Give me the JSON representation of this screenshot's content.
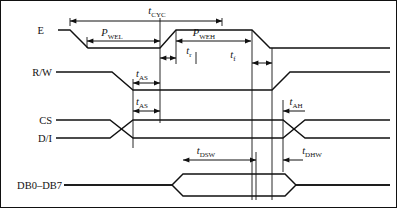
{
  "diagram": {
    "type": "timing-diagram",
    "border": {
      "color": "#111111",
      "width": 1
    },
    "signals": [
      {
        "name": "E",
        "label": "E",
        "row": "e-row"
      },
      {
        "name": "R/W",
        "label": "R/W",
        "row": "rw-row"
      },
      {
        "name": "CS",
        "label": "CS",
        "row": "cs-row"
      },
      {
        "name": "D/I",
        "label": "D/I",
        "row": "di-row"
      },
      {
        "name": "DB0-DB7",
        "label": "DB0–DB7",
        "row": "db-row"
      }
    ],
    "timings": [
      {
        "id": "tCYC",
        "base": "t",
        "sub": "CYC",
        "x": 157,
        "y": 14,
        "span": [
          70,
          222
        ],
        "arrow_y": 21
      },
      {
        "id": "PWEL",
        "base": "P",
        "sub": "WEL",
        "x": 112,
        "y": 34,
        "span": [
          87,
          160
        ],
        "arrow_y": 41
      },
      {
        "id": "PWEH",
        "base": "P",
        "sub": "WEH",
        "x": 200,
        "y": 34,
        "span": [
          176,
          251
        ],
        "arrow_y": 41
      },
      {
        "id": "tr",
        "base": "t",
        "sub": "r",
        "x": 188,
        "y": 52,
        "span": [
          176,
          196
        ],
        "arrow_y": 58
      },
      {
        "id": "tf",
        "base": "t",
        "sub": "f",
        "x": 232,
        "y": 56,
        "span": [
          252,
          272
        ],
        "arrow_y": 63
      },
      {
        "id": "tAS1",
        "base": "t",
        "sub": "AS",
        "x": 140,
        "y": 75,
        "span": [
          133,
          160
        ],
        "arrow_y": 83
      },
      {
        "id": "tAS2",
        "base": "t",
        "sub": "AS",
        "x": 140,
        "y": 103,
        "span": [
          133,
          160
        ],
        "arrow_y": 111
      },
      {
        "id": "tAH",
        "base": "t",
        "sub": "AH",
        "x": 292,
        "y": 104,
        "span": [
          283,
          305
        ],
        "arrow_y": 111
      },
      {
        "id": "tDSW",
        "base": "t",
        "sub": "DSW",
        "x": 203,
        "y": 152,
        "span": [
          183,
          256
        ],
        "arrow_y": 160
      },
      {
        "id": "tDHW",
        "base": "t",
        "sub": "DHW",
        "x": 307,
        "y": 152,
        "span": [
          283,
          305
        ],
        "arrow_y": 160
      }
    ],
    "colors": {
      "line": "#111111",
      "background": "#ffffff"
    }
  }
}
